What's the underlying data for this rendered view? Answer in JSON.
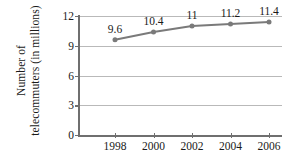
{
  "chart_data": {
    "type": "line",
    "title": "",
    "xlabel": "",
    "ylabel_line1": "Number of",
    "ylabel_line2": "telecommuters (in millions)",
    "ylabel": "Number of telecommuters (in millions)",
    "categories": [
      "1998",
      "2000",
      "2002",
      "2004",
      "2006"
    ],
    "x": [
      1998,
      2000,
      2002,
      2004,
      2006
    ],
    "values": [
      9.6,
      10.4,
      11,
      11.2,
      11.4
    ],
    "point_labels": [
      "9.6",
      "10.4",
      "11",
      "11.2",
      "11.4"
    ],
    "yticks": [
      0,
      3,
      6,
      9,
      12
    ],
    "ytick_labels": [
      "0",
      "3",
      "6",
      "9",
      "12"
    ],
    "ylim": [
      0,
      12
    ],
    "xlim": [
      1997,
      2007
    ],
    "grid": true,
    "legend": "none",
    "series_color": "#7a7a7a",
    "grid_color": "#b9b9b9",
    "axis_color": "#6f6f6f",
    "background_color": "#ffffff",
    "marker": "circle"
  }
}
